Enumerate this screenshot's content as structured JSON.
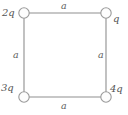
{
  "figure": {
    "type": "physics-diagram",
    "canvas": {
      "width": 128,
      "height": 115,
      "background": "#ffffff"
    },
    "style": {
      "line_color": "#8f8f8f",
      "node_stroke": "#9a9a9a",
      "node_fill": "#fdfdfd",
      "label_color": "#595959",
      "line_width": 1.1,
      "node_radius": 5.2
    },
    "square": {
      "left": 24,
      "top": 13,
      "right": 106,
      "bottom": 97,
      "side_length_label": "a"
    },
    "charges": [
      {
        "id": "top-left",
        "label": "2q",
        "cx": 24,
        "cy": 13
      },
      {
        "id": "top-right",
        "label": "q",
        "cx": 106,
        "cy": 13
      },
      {
        "id": "bottom-left",
        "label": "3q",
        "cx": 24,
        "cy": 97
      },
      {
        "id": "bottom-right",
        "label": "4q",
        "cx": 106,
        "cy": 97
      }
    ],
    "sides": [
      {
        "id": "top",
        "label": "a"
      },
      {
        "id": "left",
        "label": "a"
      },
      {
        "id": "right",
        "label": "a"
      },
      {
        "id": "bottom",
        "label": "a"
      }
    ]
  }
}
